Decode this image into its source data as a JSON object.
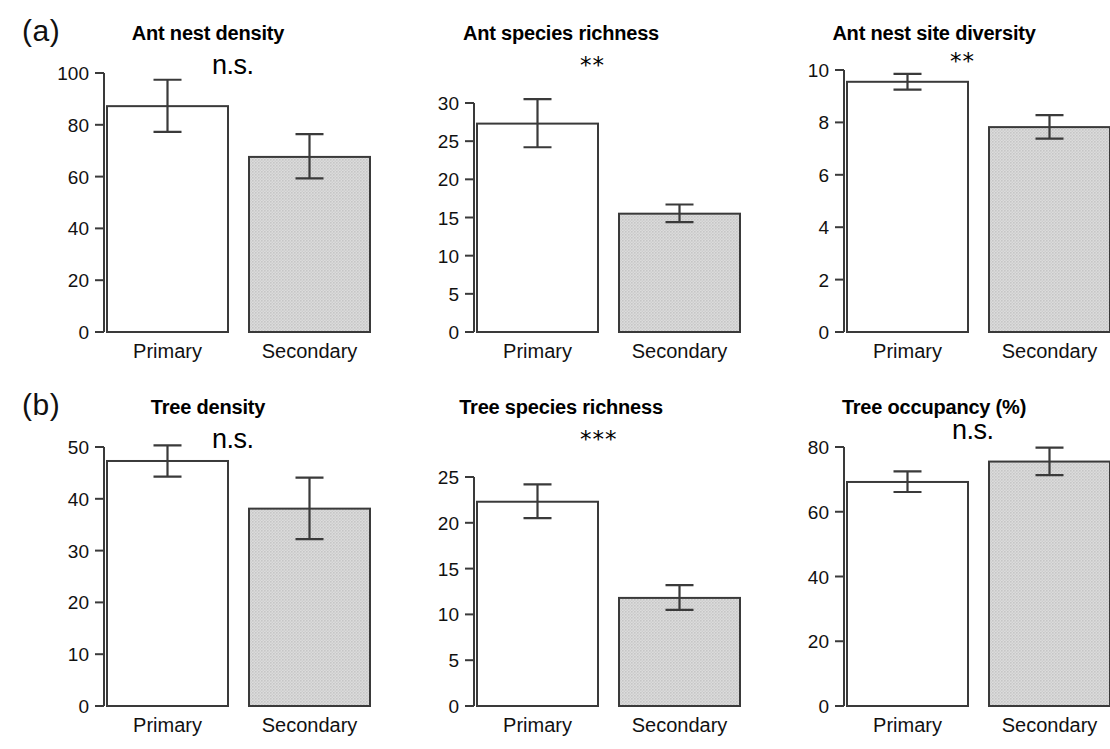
{
  "figure": {
    "background": "#ffffff",
    "axis_color": "#3a3a3a",
    "bar_open_fill": "#ffffff",
    "bar_filled_fill": "#d3d3d3",
    "text_color": "#111111"
  },
  "rows": [
    {
      "label": "(a)"
    },
    {
      "label": "(b)"
    }
  ],
  "categories": [
    "Primary",
    "Secondary"
  ],
  "chart_data": [
    {
      "type": "bar",
      "panel": "a1",
      "title": "Ant nest density",
      "annotation": "n.s.",
      "annotation_kind": "ns",
      "categories": [
        "Primary",
        "Secondary"
      ],
      "values": [
        87.2,
        67.6
      ],
      "errors_low": [
        77.3,
        59.3
      ],
      "errors_high": [
        97.4,
        76.4
      ],
      "ylim": [
        0,
        100
      ],
      "yticks": [
        0,
        20,
        40,
        60,
        80,
        100
      ],
      "ytick_labels": [
        "0",
        "20",
        "40",
        "60",
        "80",
        "100"
      ],
      "xlabel": "",
      "ylabel": "",
      "grid": false,
      "legend": "none",
      "bar_styles": [
        "open",
        "filled"
      ]
    },
    {
      "type": "bar",
      "panel": "a2",
      "title": "Ant species richness",
      "annotation": "**",
      "annotation_kind": "stars",
      "categories": [
        "Primary",
        "Secondary"
      ],
      "values": [
        27.3,
        15.5
      ],
      "errors_low": [
        24.2,
        14.4
      ],
      "errors_high": [
        30.5,
        16.7
      ],
      "ylim": [
        0,
        30
      ],
      "yticks": [
        0,
        5,
        10,
        15,
        20,
        25,
        30
      ],
      "ytick_labels": [
        "0",
        "5",
        "10",
        "15",
        "20",
        "25",
        "30"
      ],
      "xlabel": "",
      "ylabel": "",
      "grid": false,
      "legend": "none",
      "bar_styles": [
        "open",
        "filled"
      ]
    },
    {
      "type": "bar",
      "panel": "a3",
      "title": "Ant nest site diversity",
      "annotation": "**",
      "annotation_kind": "stars",
      "categories": [
        "Primary",
        "Secondary"
      ],
      "values": [
        9.55,
        7.82
      ],
      "errors_low": [
        9.25,
        7.38
      ],
      "errors_high": [
        9.85,
        8.28
      ],
      "ylim": [
        0,
        10
      ],
      "yticks": [
        0,
        2,
        4,
        6,
        8,
        10
      ],
      "ytick_labels": [
        "0",
        "2",
        "4",
        "6",
        "8",
        "10"
      ],
      "xlabel": "",
      "ylabel": "",
      "grid": false,
      "legend": "none",
      "bar_styles": [
        "open",
        "filled"
      ]
    },
    {
      "type": "bar",
      "panel": "b1",
      "title": "Tree density",
      "annotation": "n.s.",
      "annotation_kind": "ns",
      "categories": [
        "Primary",
        "Secondary"
      ],
      "values": [
        47.3,
        38.1
      ],
      "errors_low": [
        44.3,
        32.2
      ],
      "errors_high": [
        50.3,
        44.1
      ],
      "ylim": [
        0,
        50
      ],
      "yticks": [
        0,
        10,
        20,
        30,
        40,
        50
      ],
      "ytick_labels": [
        "0",
        "10",
        "20",
        "30",
        "40",
        "50"
      ],
      "xlabel": "",
      "ylabel": "",
      "grid": false,
      "legend": "none",
      "bar_styles": [
        "open",
        "filled"
      ]
    },
    {
      "type": "bar",
      "panel": "b2",
      "title": "Tree species richness",
      "annotation": "***",
      "annotation_kind": "stars",
      "categories": [
        "Primary",
        "Secondary"
      ],
      "values": [
        22.3,
        11.8
      ],
      "errors_low": [
        20.5,
        10.5
      ],
      "errors_high": [
        24.2,
        13.2
      ],
      "ylim": [
        0,
        25
      ],
      "yticks": [
        0,
        5,
        10,
        15,
        20,
        25
      ],
      "ytick_labels": [
        "0",
        "5",
        "10",
        "15",
        "20",
        "25"
      ],
      "xlabel": "",
      "ylabel": "",
      "grid": false,
      "legend": "none",
      "bar_styles": [
        "open",
        "filled"
      ]
    },
    {
      "type": "bar",
      "panel": "b3",
      "title": "Tree occupancy (%)",
      "annotation": "n.s.",
      "annotation_kind": "ns",
      "categories": [
        "Primary",
        "Secondary"
      ],
      "values": [
        69.2,
        75.5
      ],
      "errors_low": [
        66.1,
        71.3
      ],
      "errors_high": [
        72.5,
        79.8
      ],
      "ylim": [
        0,
        80
      ],
      "yticks": [
        0,
        20,
        40,
        60,
        80
      ],
      "ytick_labels": [
        "0",
        "20",
        "40",
        "60",
        "80"
      ],
      "xlabel": "",
      "ylabel": "",
      "grid": false,
      "legend": "none",
      "bar_styles": [
        "open",
        "filled"
      ]
    }
  ]
}
